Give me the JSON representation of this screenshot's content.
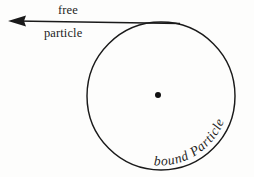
{
  "figure": {
    "background_color": "#fdfdfc",
    "ink_color": "#1a1a1a",
    "free_label": {
      "line1": "free",
      "line2": "particle"
    },
    "bound_label": {
      "word1": "bound",
      "word2": "Particle",
      "full": "bound Particle"
    },
    "geometry": {
      "circle_center_x": 161,
      "circle_center_y": 96,
      "circle_radius": 74,
      "center_dot_x": 158,
      "center_dot_y": 95,
      "center_dot_radius": 3,
      "arrow_tip_x": 8,
      "arrow_tip_y": 21,
      "arrow_tail_x": 180,
      "arrow_tail_y": 23
    }
  }
}
